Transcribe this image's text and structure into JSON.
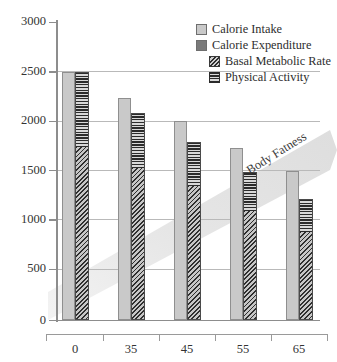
{
  "chart_data": {
    "type": "bar",
    "title": "",
    "xlabel": "",
    "ylabel": "",
    "categories": [
      "0",
      "35",
      "45",
      "55",
      "65"
    ],
    "ylim": [
      0,
      3000
    ],
    "yticks": [
      0,
      500,
      1000,
      1500,
      2000,
      2500,
      3000
    ],
    "ytick_labels": [
      "0",
      "500",
      "1000",
      "1500",
      "2000",
      "2500",
      "3000"
    ],
    "grid": true,
    "legend_position": "top-right",
    "series": [
      {
        "name": "Calorie Intake",
        "swatch": "light-gray-solid",
        "color": "#c9c9c9",
        "stacked": false,
        "values": [
          2500,
          2240,
          2000,
          1730,
          1500
        ]
      },
      {
        "name": "Calorie Expenditure",
        "swatch": "dark-gray-solid",
        "color": "#7a7a7a",
        "stacked": true,
        "values": [
          2500,
          2080,
          1790,
          1490,
          1220
        ]
      },
      {
        "name": "Basal Metabolic Rate",
        "swatch": "diagonal-hatch",
        "color": "#777777",
        "part_of": "Calorie Expenditure",
        "values": [
          1750,
          1540,
          1360,
          1110,
          900
        ]
      },
      {
        "name": "Physical Activity",
        "swatch": "checkered",
        "color": "#2b2b2b",
        "part_of": "Calorie Expenditure",
        "values": [
          750,
          540,
          430,
          380,
          320
        ]
      }
    ],
    "annotations": [
      {
        "text": "Body Fatness",
        "type": "diagonal-band-label",
        "rotation_deg": -32,
        "direction": "increasing-left-to-right"
      }
    ]
  },
  "legend": {
    "items": [
      {
        "label": "Calorie Intake",
        "icon": "legend-swatch-solid-light"
      },
      {
        "label": "Calorie Expenditure",
        "icon": "legend-swatch-solid-dark"
      },
      {
        "label": "Basal Metabolic Rate",
        "icon": "legend-swatch-hatch"
      },
      {
        "label": "Physical Activity",
        "icon": "legend-swatch-checker"
      }
    ]
  },
  "axes": {
    "y_labels": [
      "3000",
      "2500",
      "2000",
      "1500",
      "1000",
      "500",
      "0"
    ],
    "x_labels": [
      "0",
      "35",
      "45",
      "55",
      "65"
    ]
  },
  "band": {
    "label": "Body Fatness"
  },
  "colors": {
    "intake": "#c9c9c9",
    "expenditure": "#7a7a7a",
    "bmr": "#777777",
    "physical_activity": "#2b2b2b",
    "grid": "#b9b9b9",
    "axis": "#8d8d8d",
    "band": "#e8e8e8"
  }
}
